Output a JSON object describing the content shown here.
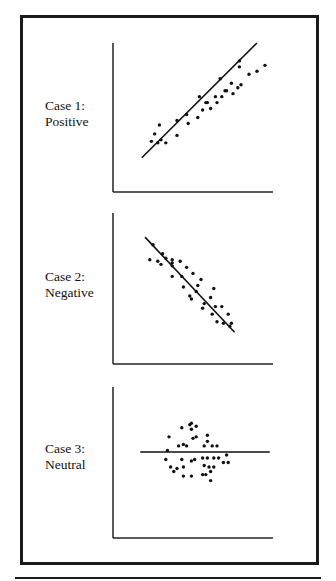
{
  "chart_data": [
    {
      "type": "scatter",
      "title": "",
      "label_line1": "Case 1:",
      "label_line2": "Positive",
      "xlabel": "",
      "ylabel": "",
      "xlim": [
        0,
        100
      ],
      "ylim": [
        0,
        100
      ],
      "grid": false,
      "trend_line": {
        "x": [
          18,
          90
        ],
        "y": [
          23,
          100
        ]
      },
      "points": [
        [
          24,
          34
        ],
        [
          28,
          33
        ],
        [
          33,
          33
        ],
        [
          30,
          35
        ],
        [
          26,
          39
        ],
        [
          40,
          38
        ],
        [
          29,
          45
        ],
        [
          40,
          48
        ],
        [
          46,
          52
        ],
        [
          47,
          46
        ],
        [
          53,
          50
        ],
        [
          59,
          60
        ],
        [
          56,
          55
        ],
        [
          61,
          56
        ],
        [
          54,
          64
        ],
        [
          65,
          60
        ],
        [
          58,
          60
        ],
        [
          68,
          64
        ],
        [
          64,
          64
        ],
        [
          70,
          68
        ],
        [
          71,
          68
        ],
        [
          75,
          66
        ],
        [
          67,
          76
        ],
        [
          74,
          73
        ],
        [
          80,
          72
        ],
        [
          78,
          70
        ],
        [
          85,
          79
        ],
        [
          90,
          81
        ],
        [
          95,
          85
        ],
        [
          79,
          84
        ],
        [
          79,
          88
        ]
      ]
    },
    {
      "type": "scatter",
      "title": "",
      "label_line1": "Case 2:",
      "label_line2": "Negative",
      "xlabel": "",
      "ylabel": "",
      "xlim": [
        0,
        100
      ],
      "ylim": [
        0,
        100
      ],
      "grid": false,
      "trend_line": {
        "x": [
          20,
          76
        ],
        "y": [
          84,
          21
        ]
      },
      "points": [
        [
          25,
          79
        ],
        [
          31,
          73
        ],
        [
          33,
          70
        ],
        [
          23,
          69
        ],
        [
          28,
          68
        ],
        [
          30,
          66
        ],
        [
          37,
          69
        ],
        [
          37,
          67
        ],
        [
          37,
          65
        ],
        [
          42,
          68
        ],
        [
          46,
          64
        ],
        [
          37,
          58
        ],
        [
          43,
          58
        ],
        [
          50,
          60
        ],
        [
          55,
          56
        ],
        [
          53,
          52
        ],
        [
          44,
          51
        ],
        [
          52,
          48
        ],
        [
          63,
          50
        ],
        [
          61,
          44
        ],
        [
          48,
          45
        ],
        [
          49,
          43
        ],
        [
          57,
          40
        ],
        [
          56,
          37
        ],
        [
          64,
          38
        ],
        [
          68,
          38
        ],
        [
          62,
          33
        ],
        [
          72,
          33
        ],
        [
          65,
          28
        ],
        [
          69,
          27
        ],
        [
          74,
          27
        ],
        [
          73,
          25
        ]
      ]
    },
    {
      "type": "scatter",
      "title": "",
      "label_line1": "Case 3:",
      "label_line2": "Neutral",
      "xlabel": "",
      "ylabel": "",
      "xlim": [
        0,
        100
      ],
      "ylim": [
        0,
        100
      ],
      "grid": false,
      "trend_line": {
        "x": [
          17,
          98
        ],
        "y": [
          57,
          57
        ]
      },
      "points": [
        [
          48,
          75
        ],
        [
          49,
          76
        ],
        [
          49,
          72
        ],
        [
          52,
          74
        ],
        [
          43,
          73
        ],
        [
          35,
          67
        ],
        [
          50,
          66
        ],
        [
          52,
          67
        ],
        [
          59,
          68
        ],
        [
          59,
          64
        ],
        [
          41,
          61
        ],
        [
          44,
          62
        ],
        [
          46,
          61
        ],
        [
          57,
          61
        ],
        [
          62,
          61
        ],
        [
          65,
          61
        ],
        [
          34,
          58
        ],
        [
          71,
          55
        ],
        [
          33,
          52
        ],
        [
          43,
          52
        ],
        [
          49,
          51
        ],
        [
          51,
          52
        ],
        [
          56,
          53
        ],
        [
          59,
          53
        ],
        [
          63,
          53
        ],
        [
          66,
          53
        ],
        [
          36,
          47
        ],
        [
          40,
          46
        ],
        [
          44,
          47
        ],
        [
          57,
          48
        ],
        [
          60,
          47
        ],
        [
          63,
          47
        ],
        [
          69,
          50
        ],
        [
          72,
          50
        ],
        [
          38,
          44
        ],
        [
          61,
          44
        ],
        [
          44,
          41
        ],
        [
          49,
          41
        ],
        [
          56,
          42
        ],
        [
          58,
          42
        ],
        [
          61,
          38
        ]
      ]
    }
  ]
}
